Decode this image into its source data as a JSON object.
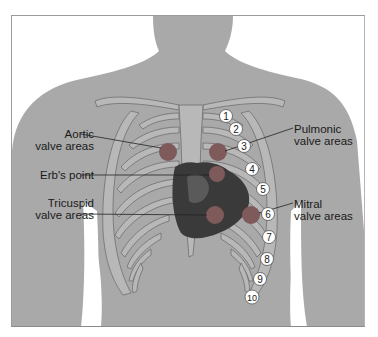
{
  "diagram": {
    "colors": {
      "body": "#a9a9a9",
      "ribs": "#b8b8b8",
      "rib_outline": "#6e6e6e",
      "valve_area": "#7e5a5a",
      "heart": "#3a3a3a",
      "label_text": "#1a1a1a",
      "frame": "#9a9a9a"
    },
    "labels": {
      "aortic": {
        "line1": "Aortic",
        "line2": "valve areas"
      },
      "erb": {
        "line1": "Erb's point"
      },
      "tricuspid": {
        "line1": "Tricuspid",
        "line2": "valve areas"
      },
      "pulmonic": {
        "line1": "Pulmonic",
        "line2": "valve areas"
      },
      "mitral": {
        "line1": "Mitral",
        "line2": "valve areas"
      }
    },
    "rib_numbers": [
      "1",
      "2",
      "3",
      "4",
      "5",
      "6",
      "7",
      "8",
      "9",
      "10"
    ]
  }
}
